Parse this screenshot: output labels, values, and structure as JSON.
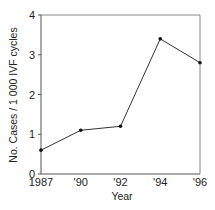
{
  "chart_data": {
    "type": "line",
    "title": "",
    "xlabel": "Year",
    "ylabel": "No. Cases / 1 000 IVF cycles",
    "categories": [
      "1987",
      "'90",
      "'92",
      "'94",
      "'96"
    ],
    "series": [
      {
        "name": "Cases",
        "values": [
          0.6,
          1.1,
          1.2,
          3.4,
          2.8
        ]
      }
    ],
    "ylim": [
      0,
      4
    ],
    "yticks": [
      0,
      1,
      2,
      3,
      4
    ],
    "grid": false,
    "legend": "none",
    "frame": "box"
  },
  "colors": {
    "line": "#333333",
    "marker": "#111111",
    "axis": "#555555",
    "frame": "#888888"
  }
}
